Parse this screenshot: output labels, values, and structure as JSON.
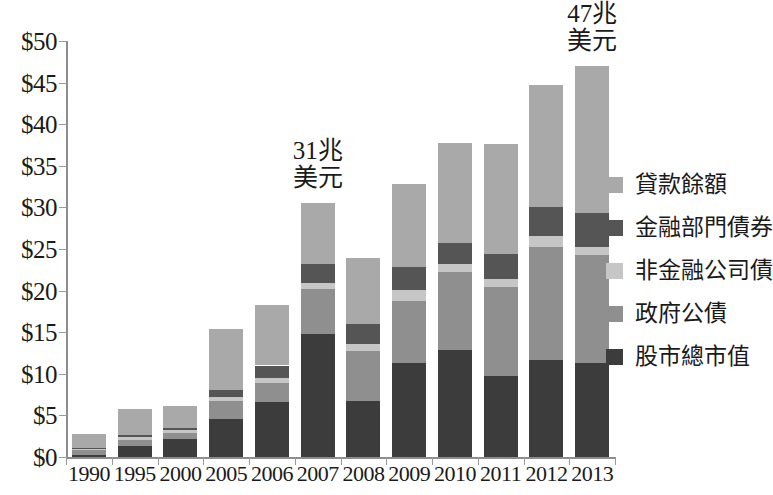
{
  "chart_data": {
    "type": "bar",
    "subtype": "stacked",
    "title": "",
    "xlabel": "",
    "ylabel": "",
    "ylim": [
      0,
      50
    ],
    "ytick_step": 5,
    "ytick_prefix": "$",
    "grid": false,
    "legend_position": "right",
    "categories": [
      "1990",
      "1995",
      "2000",
      "2005",
      "2006",
      "2007",
      "2008",
      "2009",
      "2010",
      "2011",
      "2012",
      "2013"
    ],
    "ytick_labels": [
      "$0",
      "$5",
      "$10",
      "$15",
      "$20",
      "$25",
      "$30",
      "$35",
      "$40",
      "$45",
      "$50"
    ],
    "ytick_values": [
      0,
      5,
      10,
      15,
      20,
      25,
      30,
      35,
      40,
      45,
      50
    ],
    "series": [
      {
        "name": "股市總市值",
        "color": "#3c3c3c",
        "values": [
          0.3,
          1.3,
          2.2,
          4.6,
          6.6,
          14.8,
          6.7,
          11.3,
          12.9,
          9.7,
          11.7,
          11.3
        ]
      },
      {
        "name": "政府公債",
        "color": "#8f8f8f",
        "values": [
          0.5,
          0.8,
          0.7,
          2.1,
          2.3,
          5.4,
          6.0,
          7.5,
          9.3,
          10.7,
          13.5,
          13.0
        ]
      },
      {
        "name": "非金融公司債",
        "color": "#c6c6c6",
        "values": [
          0.2,
          0.3,
          0.3,
          0.5,
          0.6,
          0.7,
          0.9,
          1.3,
          1.0,
          1.0,
          1.4,
          1.0
        ]
      },
      {
        "name": "金融部門債券",
        "color": "#555555",
        "values": [
          0.1,
          0.2,
          0.3,
          0.8,
          1.5,
          2.3,
          2.4,
          2.7,
          2.5,
          3.0,
          3.5,
          4.0
        ]
      },
      {
        "name": "貸款餘額",
        "color": "#a9a9a9",
        "values": [
          1.7,
          3.2,
          2.6,
          7.4,
          7.3,
          7.3,
          7.9,
          10.0,
          12.0,
          13.2,
          14.6,
          17.7
        ]
      }
    ],
    "totals": [
      2.8,
      5.8,
      6.1,
      15.4,
      18.3,
      30.5,
      23.9,
      32.8,
      37.7,
      37.6,
      44.7,
      47.0
    ],
    "annotations": [
      {
        "text": "31兆\n美元",
        "category": "2007"
      },
      {
        "text": "47兆\n美元",
        "category": "2013"
      }
    ]
  },
  "legend": {
    "items": [
      {
        "label": "貸款餘額",
        "color": "#a9a9a9",
        "swatch_name": "legend-swatch-loans"
      },
      {
        "label": "金融部門債券",
        "color": "#555555",
        "swatch_name": "legend-swatch-financial-bonds"
      },
      {
        "label": "非金融公司債",
        "color": "#c6c6c6",
        "swatch_name": "legend-swatch-nonfinancial-bonds"
      },
      {
        "label": "政府公債",
        "color": "#8f8f8f",
        "swatch_name": "legend-swatch-government-bonds"
      },
      {
        "label": "股市總市值",
        "color": "#3c3c3c",
        "swatch_name": "legend-swatch-stock-market"
      }
    ]
  },
  "axis_colors": {
    "axis_line": "#8d8d8d",
    "tick": "#9a9a9a",
    "text": "#1a1a1a",
    "background": "#ffffff"
  }
}
